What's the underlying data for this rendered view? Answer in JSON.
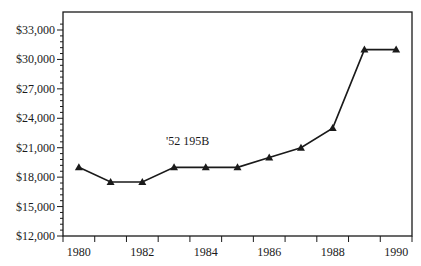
{
  "chart_data": {
    "type": "line",
    "title": "",
    "xlabel": "",
    "ylabel": "",
    "x": [
      1980,
      1981,
      1982,
      1983,
      1984,
      1985,
      1986,
      1987,
      1988,
      1989,
      1990
    ],
    "series": [
      {
        "name": "'52 195B",
        "values": [
          19000,
          17500,
          17500,
          19000,
          19000,
          19000,
          20000,
          21000,
          23000,
          31000,
          31000
        ],
        "marker": "triangle",
        "color": "#1a1a1a"
      }
    ],
    "x_tick_labels": [
      "1980",
      "1982",
      "1984",
      "1986",
      "1988",
      "1990"
    ],
    "y_tick_labels": [
      "$12,000",
      "$15,000",
      "$18,000",
      "$21,000",
      "$24,000",
      "$27,000",
      "$30,000",
      "$33,000"
    ],
    "y_ticks": [
      12000,
      15000,
      18000,
      21000,
      24000,
      27000,
      30000,
      33000
    ],
    "ylim": [
      12000,
      33700
    ],
    "xlim": [
      1979.5,
      1990.5
    ],
    "grid": false,
    "legend": "none",
    "annotations": [
      {
        "text": "'52 195B",
        "x": 1983,
        "y": 22000
      }
    ]
  }
}
